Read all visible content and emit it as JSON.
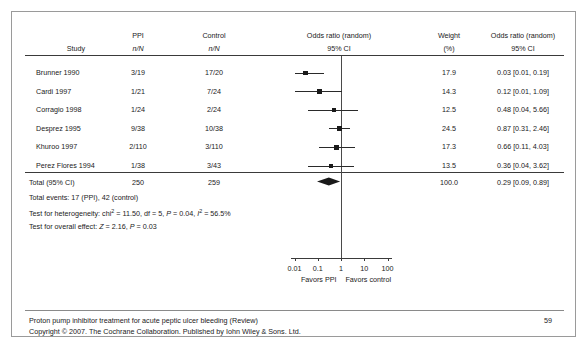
{
  "document": {
    "footer_line1": "Proton pump inhibitor treatment for acute peptic ulcer bleeding (Review)",
    "footer_line2": "Copyright © 2007. The Cochrane Collaboration. Published by Iohn Wiley & Sons. Ltd.",
    "page_number": "59"
  },
  "table": {
    "headers": {
      "study_top": "",
      "study": "Study",
      "ppi_top": "PPI",
      "ppi_sub": "n/N",
      "control_top": "Control",
      "control_sub": "n/N",
      "plot_top": "Odds ratio (random)",
      "plot_sub": "95% CI",
      "weight_top": "Weight",
      "weight_sub": "(%)",
      "or_top": "Odds ratio (random)",
      "or_sub": "95% CI"
    },
    "rows": [
      {
        "study": "Brunner 1990",
        "ppi": "3/19",
        "control": "17/20",
        "weight": "17.9",
        "or_text": "0.03 [0.01, 0.19]"
      },
      {
        "study": "Cardi 1997",
        "ppi": "1/21",
        "control": "7/24",
        "weight": "14.3",
        "or_text": "0.12 [0.01, 1.09]"
      },
      {
        "study": "Corragio 1998",
        "ppi": "1/24",
        "control": "2/24",
        "weight": "12.5",
        "or_text": "0.48 [0.04, 5.66]"
      },
      {
        "study": "Desprez 1995",
        "ppi": "9/38",
        "control": "10/38",
        "weight": "24.5",
        "or_text": "0.87 [0.31, 2.46]"
      },
      {
        "study": "Khuroo 1997",
        "ppi": "2/110",
        "control": "3/110",
        "weight": "17.3",
        "or_text": "0.66 [0.11, 4.03]"
      },
      {
        "study": "Perez Flores 1994",
        "ppi": "1/38",
        "control": "3/43",
        "weight": "13.5",
        "or_text": "0.36 [0.04, 3.62]"
      }
    ],
    "total": {
      "label": "Total (95% CI)",
      "ppi": "250",
      "control": "259",
      "weight": "100.0",
      "or_text": "0.29 [0.09, 0.89]"
    },
    "notes": [
      "Total events: 17 (PPI), 42 (control)",
      "Test for heterogeneity: chi² = 11.50, df = 5, P = 0.04, I² = 56.5%",
      "Test for overall effect: Z = 2.16, P = 0.03"
    ]
  },
  "chart_data": {
    "type": "forest",
    "xlabel": "",
    "scale": "log",
    "xlim": [
      0.01,
      100
    ],
    "ticks": [
      "0.01",
      "0.1",
      "1",
      "10",
      "100"
    ],
    "tick_values": [
      0.01,
      0.1,
      1,
      10,
      100
    ],
    "null_line": 1,
    "left_label": "Favors PPI",
    "right_label": "Favors control",
    "studies": [
      {
        "name": "Brunner 1990",
        "or": 0.03,
        "lo": 0.01,
        "hi": 0.19,
        "weight": 17.9,
        "events_t": 3,
        "n_t": 19,
        "events_c": 17,
        "n_c": 20
      },
      {
        "name": "Cardi 1997",
        "or": 0.12,
        "lo": 0.01,
        "hi": 1.09,
        "weight": 14.3,
        "events_t": 1,
        "n_t": 21,
        "events_c": 7,
        "n_c": 24
      },
      {
        "name": "Corragio 1998",
        "or": 0.48,
        "lo": 0.04,
        "hi": 5.66,
        "weight": 12.5,
        "events_t": 1,
        "n_t": 24,
        "events_c": 2,
        "n_c": 24
      },
      {
        "name": "Desprez 1995",
        "or": 0.87,
        "lo": 0.31,
        "hi": 2.46,
        "weight": 24.5,
        "events_t": 9,
        "n_t": 38,
        "events_c": 10,
        "n_c": 38
      },
      {
        "name": "Khuroo 1997",
        "or": 0.66,
        "lo": 0.11,
        "hi": 4.03,
        "weight": 17.3,
        "events_t": 2,
        "n_t": 110,
        "events_c": 3,
        "n_c": 110
      },
      {
        "name": "Perez Flores 1994",
        "or": 0.36,
        "lo": 0.04,
        "hi": 3.62,
        "weight": 13.5,
        "events_t": 1,
        "n_t": 38,
        "events_c": 3,
        "n_c": 43
      }
    ],
    "summary": {
      "name": "Total (95% CI)",
      "or": 0.29,
      "lo": 0.09,
      "hi": 0.89,
      "weight": 100.0,
      "n_t": 250,
      "n_c": 259
    },
    "heterogeneity": {
      "chi2": 11.5,
      "df": 5,
      "p": 0.04,
      "i2": 56.5
    },
    "overall_effect": {
      "z": 2.16,
      "p": 0.03
    }
  }
}
